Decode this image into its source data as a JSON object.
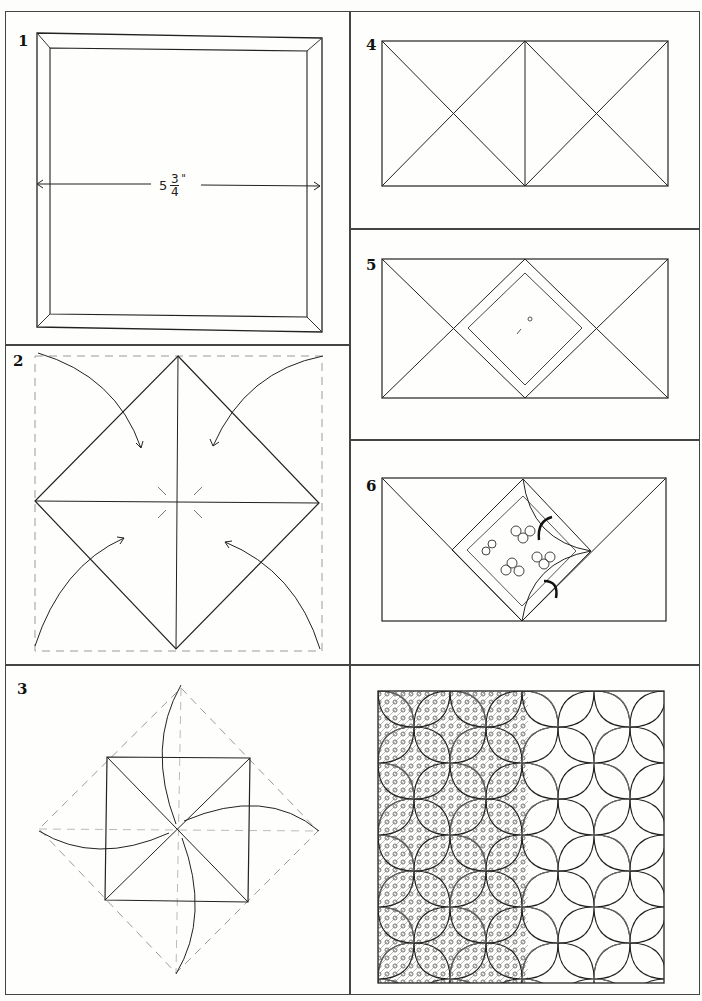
{
  "figure": {
    "panels": [
      {
        "id": "step-1",
        "number": "1",
        "caption_measure": {
          "whole": "5",
          "numerator": "3",
          "denominator": "4",
          "unit": "\""
        }
      },
      {
        "id": "step-2",
        "number": "2"
      },
      {
        "id": "step-3",
        "number": "3"
      },
      {
        "id": "step-4",
        "number": "4"
      },
      {
        "id": "step-5",
        "number": "5"
      },
      {
        "id": "step-6",
        "number": "6"
      },
      {
        "id": "finished",
        "number": ""
      }
    ]
  },
  "colors": {
    "line": "#222222",
    "dashed": "#9a9a9a",
    "panel_border": "#444444",
    "background": "#fefefc"
  }
}
